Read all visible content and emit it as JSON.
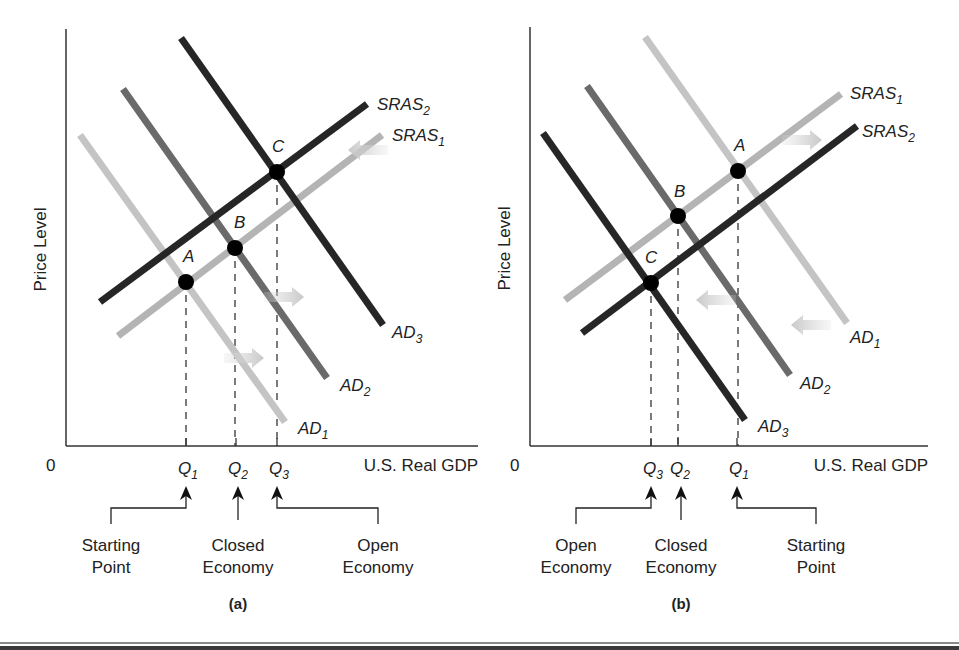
{
  "chart_data": [
    {
      "type": "line",
      "panel": "(a)",
      "title": "",
      "xlabel": "U.S. Real GDP",
      "ylabel": "Price Level",
      "origin_label": "0",
      "grid": false,
      "axis": {
        "x0": 66,
        "y0": 446,
        "xmax": 478,
        "ytop": 29
      },
      "series": [
        {
          "name": "AD",
          "sub": "1",
          "color": "#c4c4c4",
          "width": 7,
          "from": [
            80,
            135
          ],
          "to": [
            285,
            422
          ],
          "label_pos": [
            298,
            434
          ]
        },
        {
          "name": "AD",
          "sub": "2",
          "color": "#6a6a6a",
          "width": 7,
          "from": [
            123,
            89
          ],
          "to": [
            327,
            378
          ],
          "label_pos": [
            340,
            391
          ]
        },
        {
          "name": "AD",
          "sub": "3",
          "color": "#262626",
          "width": 7,
          "from": [
            181,
            38
          ],
          "to": [
            383,
            325
          ],
          "label_pos": [
            392,
            338
          ]
        },
        {
          "name": "SRAS",
          "sub": "1",
          "color": "#b4b4b4",
          "width": 7,
          "from": [
            118,
            336
          ],
          "to": [
            382,
            135
          ],
          "label_pos": [
            392,
            141
          ]
        },
        {
          "name": "SRAS",
          "sub": "2",
          "color": "#262626",
          "width": 7,
          "from": [
            100,
            302
          ],
          "to": [
            367,
            104
          ],
          "label_pos": [
            377,
            110
          ]
        }
      ],
      "points": [
        {
          "label": "A",
          "x": 186,
          "y": 282,
          "label_pos": [
            183,
            262
          ]
        },
        {
          "label": "B",
          "x": 235,
          "y": 248,
          "label_pos": [
            234,
            228
          ]
        },
        {
          "label": "C",
          "x": 277,
          "y": 172,
          "label_pos": [
            272,
            152
          ]
        }
      ],
      "quantities": [
        {
          "label": "Q",
          "sub": "1",
          "x": 186
        },
        {
          "label": "Q",
          "sub": "2",
          "x": 236
        },
        {
          "label": "Q",
          "sub": "3",
          "x": 277
        }
      ],
      "shift_arrows": [
        {
          "x": 352,
          "y": 150,
          "dir": "left"
        },
        {
          "x": 260,
          "y": 358,
          "dir": "right"
        },
        {
          "x": 300,
          "y": 297,
          "dir": "right"
        }
      ],
      "annotations": [
        {
          "lines": [
            "Starting",
            "Point"
          ],
          "cx": 111,
          "target_x": 186,
          "route": "elbow"
        },
        {
          "lines": [
            "Closed",
            "Economy"
          ],
          "cx": 238,
          "target_x": 238,
          "route": "straight"
        },
        {
          "lines": [
            "Open",
            "Economy"
          ],
          "cx": 378,
          "target_x": 277,
          "route": "elbow"
        }
      ],
      "caption": "(a)"
    },
    {
      "type": "line",
      "panel": "(b)",
      "title": "",
      "xlabel": "U.S. Real GDP",
      "ylabel": "Price Level",
      "origin_label": "0",
      "grid": false,
      "axis": {
        "x0": 530,
        "y0": 446,
        "xmax": 928,
        "ytop": 27
      },
      "series": [
        {
          "name": "AD",
          "sub": "1",
          "color": "#c4c4c4",
          "width": 7,
          "from": [
            645,
            37
          ],
          "to": [
            847,
            323
          ],
          "label_pos": [
            850,
            343
          ]
        },
        {
          "name": "AD",
          "sub": "2",
          "color": "#6a6a6a",
          "width": 7,
          "from": [
            587,
            86
          ],
          "to": [
            790,
            375
          ],
          "label_pos": [
            800,
            389
          ]
        },
        {
          "name": "AD",
          "sub": "3",
          "color": "#262626",
          "width": 7,
          "from": [
            543,
            133
          ],
          "to": [
            745,
            420
          ],
          "label_pos": [
            758,
            432
          ]
        },
        {
          "name": "SRAS",
          "sub": "1",
          "color": "#b4b4b4",
          "width": 7,
          "from": [
            565,
            300
          ],
          "to": [
            841,
            94
          ],
          "label_pos": [
            850,
            99
          ]
        },
        {
          "name": "SRAS",
          "sub": "2",
          "color": "#262626",
          "width": 7,
          "from": [
            582,
            333
          ],
          "to": [
            857,
            126
          ],
          "label_pos": [
            862,
            137
          ]
        }
      ],
      "points": [
        {
          "label": "A",
          "x": 738,
          "y": 171,
          "label_pos": [
            734,
            151
          ]
        },
        {
          "label": "B",
          "x": 678,
          "y": 216,
          "label_pos": [
            674,
            197
          ]
        },
        {
          "label": "C",
          "x": 651,
          "y": 283,
          "label_pos": [
            645,
            263
          ]
        }
      ],
      "quantities": [
        {
          "label": "Q",
          "sub": "3",
          "x": 651
        },
        {
          "label": "Q",
          "sub": "2",
          "x": 678
        },
        {
          "label": "Q",
          "sub": "1",
          "x": 737
        }
      ],
      "shift_arrows": [
        {
          "x": 818,
          "y": 140,
          "dir": "right"
        },
        {
          "x": 700,
          "y": 300,
          "dir": "left"
        },
        {
          "x": 795,
          "y": 325,
          "dir": "left"
        }
      ],
      "annotations": [
        {
          "lines": [
            "Open",
            "Economy"
          ],
          "cx": 576,
          "target_x": 651,
          "route": "elbow"
        },
        {
          "lines": [
            "Closed",
            "Economy"
          ],
          "cx": 681,
          "target_x": 681,
          "route": "straight"
        },
        {
          "lines": [
            "Starting",
            "Point"
          ],
          "cx": 816,
          "target_x": 737,
          "route": "elbow"
        }
      ],
      "caption": "(b)"
    }
  ]
}
